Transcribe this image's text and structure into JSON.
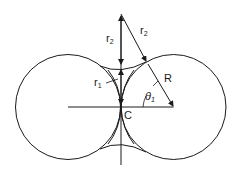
{
  "diagram": {
    "labels": {
      "r2_vertical": "r",
      "r2_vertical_sub": "2",
      "r2_slanted": "r",
      "r2_slanted_sub": "2",
      "r1": "r",
      "r1_sub": "1",
      "R": "R",
      "theta": "θ",
      "theta_sub": "1",
      "C": "C"
    },
    "colors": {
      "stroke": "#1a1a1a",
      "background": "#ffffff"
    }
  }
}
